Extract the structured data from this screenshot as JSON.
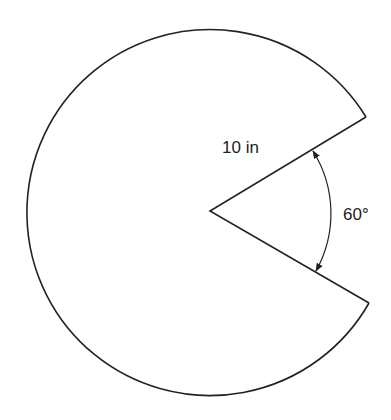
{
  "diagram": {
    "title": "",
    "shape": "circular sector with 60° wedge removed",
    "labels": {
      "radius": "10 in",
      "angle": "60°"
    },
    "geometry": {
      "center": [
        211,
        212
      ],
      "radius_px": 183,
      "vertex": [
        210,
        211
      ],
      "upper_endpoint": [
        366,
        117
      ],
      "lower_endpoint": [
        369,
        303
      ],
      "angle_arc_radius_px": 117,
      "removed_angle_deg": 60
    },
    "colors": {
      "stroke": "#222222",
      "background": "#ffffff"
    }
  }
}
